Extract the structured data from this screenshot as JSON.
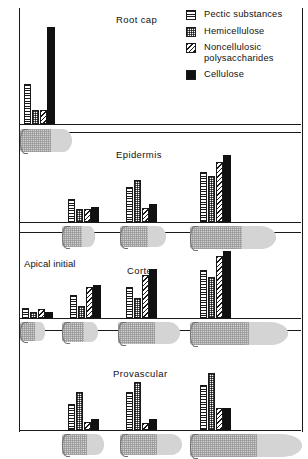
{
  "figure": {
    "title_hidden": "Cell wall polysaccharide composition in root tissues"
  },
  "legend": {
    "position": "top-right",
    "items": [
      {
        "label": "Pectic substances",
        "pattern": "horizontal-lines",
        "key": "pectic"
      },
      {
        "label": "Hemicellulose",
        "pattern": "stipple",
        "key": "hemicellulose"
      },
      {
        "label": "Noncellulosic polysaccharides",
        "pattern": "diagonal-hatch",
        "key": "noncellulosic"
      },
      {
        "label": "Cellulose",
        "pattern": "solid-black",
        "key": "cellulose"
      }
    ]
  },
  "chart_data": {
    "type": "bar",
    "title": "",
    "xlabel": "",
    "ylabel": "",
    "grid": false,
    "legend_position": "top-right",
    "series_order": [
      "pectic",
      "hemicellulose",
      "noncellulosic",
      "cellulose"
    ],
    "series_labels": [
      "Pectic substances",
      "Hemicellulose",
      "Noncellulosic polysaccharides",
      "Cellulose"
    ],
    "ylim": [
      0,
      100
    ],
    "panels": [
      {
        "name": "Root cap",
        "title": "Root cap",
        "title_align": "center-left",
        "groups": [
          {
            "stage": 1,
            "values": [
              38,
              13,
              13,
              92
            ]
          }
        ],
        "cells": [
          {
            "stage": 1,
            "length": 52,
            "height": 23
          }
        ]
      },
      {
        "name": "Epidermis",
        "title": "Epidermis",
        "title_align": "center",
        "groups": [
          {
            "stage": 1,
            "values": [
              32,
              18,
              18,
              21
            ]
          },
          {
            "stage": 2,
            "values": [
              48,
              58,
              19,
              25
            ]
          },
          {
            "stage": 3,
            "values": [
              70,
              64,
              83,
              93
            ]
          }
        ],
        "cells": [
          {
            "stage": 1,
            "length": 33,
            "height": 21
          },
          {
            "stage": 2,
            "length": 46,
            "height": 21
          },
          {
            "stage": 3,
            "length": 86,
            "height": 23
          }
        ]
      },
      {
        "name": "Cortex",
        "title": "Cortex",
        "title_align": "center",
        "extra_label": "Apical initial",
        "groups": [
          {
            "stage": 0,
            "values": [
              14,
              9,
              13,
              9
            ]
          },
          {
            "stage": 1,
            "values": [
              33,
              17,
              45,
              47
            ]
          },
          {
            "stage": 2,
            "values": [
              45,
              29,
              62,
              70
            ]
          },
          {
            "stage": 3,
            "values": [
              68,
              59,
              88,
              96
            ]
          }
        ],
        "cells": [
          {
            "stage": 0,
            "length": 25,
            "height": 19
          },
          {
            "stage": 1,
            "length": 36,
            "height": 20
          },
          {
            "stage": 2,
            "length": 62,
            "height": 22
          },
          {
            "stage": 3,
            "length": 98,
            "height": 23
          }
        ]
      },
      {
        "name": "Provascular",
        "title": "Provascular",
        "title_align": "center",
        "groups": [
          {
            "stage": 1,
            "values": [
              42,
              62,
              13,
              17
            ]
          },
          {
            "stage": 2,
            "values": [
              62,
              78,
              11,
              18
            ]
          },
          {
            "stage": 3,
            "values": [
              72,
              92,
              35,
              35
            ]
          }
        ],
        "cells": [
          {
            "stage": 1,
            "length": 42,
            "height": 21
          },
          {
            "stage": 2,
            "length": 62,
            "height": 21
          },
          {
            "stage": 3,
            "length": 112,
            "height": 23
          }
        ]
      }
    ]
  }
}
